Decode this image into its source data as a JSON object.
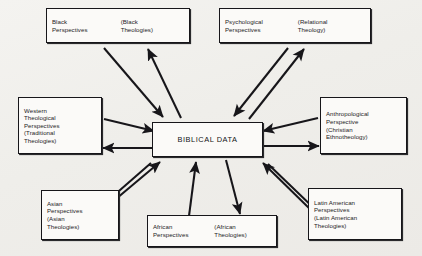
{
  "diagram": {
    "center": {
      "label": "BIBLICAL DATA"
    },
    "nodes": [
      {
        "id": "black",
        "name": "black-perspectives",
        "layout": "two-col",
        "col_a": [
          "Black",
          "Perspectives"
        ],
        "col_b": [
          "(Black",
          "Theologies)"
        ]
      },
      {
        "id": "psychological",
        "name": "psychological-perspectives",
        "layout": "two-col",
        "col_a": [
          "Psychological",
          "Perspectives"
        ],
        "col_b": [
          "(Relational",
          "Theology)"
        ]
      },
      {
        "id": "western",
        "name": "western-theological-perspectives",
        "layout": "stack",
        "lines": [
          "Western",
          "Theological",
          "Perspectives",
          "(Traditional",
          "Theologies)"
        ]
      },
      {
        "id": "anthropological",
        "name": "anthropological-perspective",
        "layout": "stack",
        "lines": [
          "Anthropological",
          "Perspective",
          "(Christian",
          "Ethnotheology)"
        ]
      },
      {
        "id": "asian",
        "name": "asian-perspectives",
        "layout": "stack",
        "lines": [
          "Asian",
          "Perspectives",
          "(Asian",
          "Theologies)"
        ]
      },
      {
        "id": "african",
        "name": "african-perspectives",
        "layout": "two-col",
        "col_a": [
          "African",
          "Perspectives"
        ],
        "col_b": [
          "(African",
          "Theologies)"
        ]
      },
      {
        "id": "latin",
        "name": "latin-american-perspectives",
        "layout": "stack",
        "lines": [
          "Latin American",
          "Perspectives",
          "(Latin American",
          "Theologies)"
        ]
      }
    ],
    "colors": {
      "ink": "#17161a",
      "paper": "#f2f1ee",
      "box_fill": "#fbfaf8"
    },
    "connections": [
      {
        "from": "black",
        "direction": "bidirectional"
      },
      {
        "from": "psychological",
        "direction": "bidirectional"
      },
      {
        "from": "western",
        "direction": "bidirectional"
      },
      {
        "from": "anthropological",
        "direction": "bidirectional"
      },
      {
        "from": "asian",
        "direction": "bidirectional"
      },
      {
        "from": "african",
        "direction": "bidirectional"
      },
      {
        "from": "latin",
        "direction": "bidirectional"
      }
    ]
  }
}
